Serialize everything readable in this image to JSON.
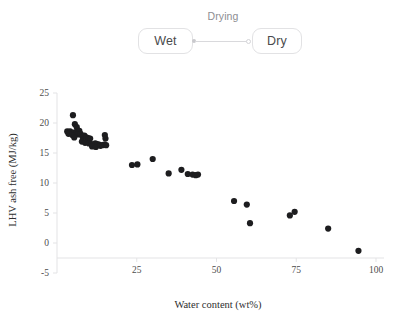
{
  "diagram": {
    "source_node": {
      "label": "Wet",
      "name": "wet-node"
    },
    "target_node": {
      "label": "Dry",
      "name": "dry-node"
    },
    "edge_label": "Drying",
    "edge_style": "line-with-source-dot-and-target-ring",
    "colors": {
      "border": "#e2e2e4",
      "text": "#4a4a4c",
      "edge": "#d9d9dc",
      "edge_label_text": "#8d8d92"
    }
  },
  "chart_data": {
    "type": "scatter",
    "title": "",
    "xlabel": "Water content (wt%)",
    "ylabel": "LHV ash free (MJ/kg)",
    "xlim": [
      0,
      100
    ],
    "ylim": [
      -5,
      25
    ],
    "xticks": [
      25,
      50,
      75,
      100
    ],
    "yticks": [
      25,
      20,
      15,
      10,
      5,
      0,
      -5
    ],
    "grid": false,
    "legend": null,
    "marker": {
      "shape": "circle",
      "color": "#1d1d1f",
      "size_px": 3.1
    },
    "series": [
      {
        "name": "biomass samples",
        "points": [
          [
            5.0,
            21.3
          ],
          [
            5.6,
            19.8
          ],
          [
            6.2,
            19.3
          ],
          [
            3.2,
            18.6
          ],
          [
            4.1,
            18.6
          ],
          [
            5.2,
            18.4
          ],
          [
            6.0,
            18.5
          ],
          [
            7.0,
            18.7
          ],
          [
            3.6,
            18.2
          ],
          [
            4.8,
            18.0
          ],
          [
            6.6,
            18.1
          ],
          [
            7.4,
            18.2
          ],
          [
            5.4,
            17.6
          ],
          [
            8.0,
            17.7
          ],
          [
            8.6,
            17.9
          ],
          [
            9.2,
            17.6
          ],
          [
            9.8,
            17.5
          ],
          [
            10.4,
            17.4
          ],
          [
            7.8,
            16.9
          ],
          [
            8.8,
            16.7
          ],
          [
            10.0,
            16.6
          ],
          [
            10.8,
            16.5
          ],
          [
            11.4,
            16.4
          ],
          [
            12.0,
            16.6
          ],
          [
            12.6,
            16.5
          ],
          [
            13.2,
            16.4
          ],
          [
            11.0,
            16.1
          ],
          [
            12.2,
            16.0
          ],
          [
            13.6,
            16.2
          ],
          [
            14.2,
            16.3
          ],
          [
            14.8,
            16.4
          ],
          [
            15.4,
            16.3
          ],
          [
            15.0,
            18.0
          ],
          [
            15.2,
            17.4
          ],
          [
            23.5,
            13.0
          ],
          [
            25.2,
            13.1
          ],
          [
            30.0,
            14.0
          ],
          [
            35.0,
            11.6
          ],
          [
            39.0,
            12.2
          ],
          [
            41.0,
            11.5
          ],
          [
            42.5,
            11.4
          ],
          [
            43.5,
            11.3
          ],
          [
            44.2,
            11.4
          ],
          [
            55.5,
            7.0
          ],
          [
            59.5,
            6.4
          ],
          [
            60.5,
            3.3
          ],
          [
            73.0,
            4.6
          ],
          [
            74.5,
            5.2
          ],
          [
            85.0,
            2.4
          ],
          [
            94.5,
            -1.3
          ]
        ]
      }
    ]
  }
}
